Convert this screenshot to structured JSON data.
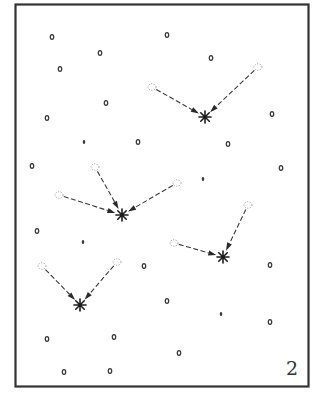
{
  "figure": {
    "panel_label": "2",
    "colors": {
      "frame": "#333333",
      "dot": "#3a3a3a",
      "ghost": "#9a9a9a",
      "star": "#1e1e1e"
    }
  },
  "chart_data": {
    "type": "scatter",
    "title": "",
    "xlabel": "",
    "ylabel": "",
    "coordinate_units": "image pixels of original figure",
    "particles": [
      {
        "x": 52,
        "y": 37,
        "size": "normal"
      },
      {
        "x": 167,
        "y": 35,
        "size": "normal"
      },
      {
        "x": 100,
        "y": 53,
        "size": "normal"
      },
      {
        "x": 211,
        "y": 58,
        "size": "normal"
      },
      {
        "x": 60,
        "y": 69,
        "size": "normal"
      },
      {
        "x": 106,
        "y": 103,
        "size": "normal"
      },
      {
        "x": 47,
        "y": 118,
        "size": "normal"
      },
      {
        "x": 272,
        "y": 114,
        "size": "normal"
      },
      {
        "x": 84,
        "y": 142,
        "size": "small"
      },
      {
        "x": 138,
        "y": 142,
        "size": "normal"
      },
      {
        "x": 228,
        "y": 144,
        "size": "normal"
      },
      {
        "x": 32,
        "y": 166,
        "size": "normal"
      },
      {
        "x": 281,
        "y": 168,
        "size": "normal"
      },
      {
        "x": 203,
        "y": 179,
        "size": "small"
      },
      {
        "x": 37,
        "y": 231,
        "size": "normal"
      },
      {
        "x": 83,
        "y": 242,
        "size": "small"
      },
      {
        "x": 144,
        "y": 266,
        "size": "normal"
      },
      {
        "x": 270,
        "y": 265,
        "size": "normal"
      },
      {
        "x": 167,
        "y": 301,
        "size": "normal"
      },
      {
        "x": 221,
        "y": 314,
        "size": "small"
      },
      {
        "x": 270,
        "y": 322,
        "size": "normal"
      },
      {
        "x": 47,
        "y": 339,
        "size": "normal"
      },
      {
        "x": 114,
        "y": 337,
        "size": "normal"
      },
      {
        "x": 179,
        "y": 353,
        "size": "normal"
      },
      {
        "x": 64,
        "y": 372,
        "size": "normal"
      },
      {
        "x": 110,
        "y": 371,
        "size": "normal"
      }
    ],
    "mergers": [
      {
        "star": {
          "x": 205,
          "y": 117
        },
        "sources": [
          {
            "x": 152,
            "y": 87
          },
          {
            "x": 258,
            "y": 67
          }
        ]
      },
      {
        "star": {
          "x": 122,
          "y": 215
        },
        "sources": [
          {
            "x": 95,
            "y": 167
          },
          {
            "x": 59,
            "y": 195
          },
          {
            "x": 177,
            "y": 183
          }
        ]
      },
      {
        "star": {
          "x": 223,
          "y": 257
        },
        "sources": [
          {
            "x": 174,
            "y": 243
          },
          {
            "x": 248,
            "y": 205
          }
        ]
      },
      {
        "star": {
          "x": 80,
          "y": 305
        },
        "sources": [
          {
            "x": 42,
            "y": 266
          },
          {
            "x": 117,
            "y": 262
          }
        ]
      }
    ]
  }
}
